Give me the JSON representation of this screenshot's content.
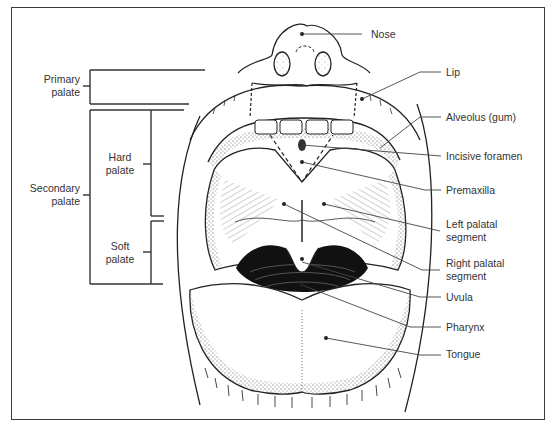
{
  "figure": {
    "left_labels": {
      "primary_palate": [
        "Primary",
        "palate"
      ],
      "secondary_palate": [
        "Secondary",
        "palate"
      ],
      "hard_palate": [
        "Hard",
        "palate"
      ],
      "soft_palate": [
        "Soft",
        "palate"
      ]
    },
    "right_labels": {
      "nose": "Nose",
      "lip": "Lip",
      "alveolus": "Alveolus (gum)",
      "incisive_foramen": "Incisive foramen",
      "premaxilla": "Premaxilla",
      "left_palatal_segment": [
        "Left palatal",
        "segment"
      ],
      "right_palatal_segment": [
        "Right palatal",
        "segment"
      ],
      "uvula": "Uvula",
      "pharynx": "Pharynx",
      "tongue": "Tongue"
    }
  }
}
